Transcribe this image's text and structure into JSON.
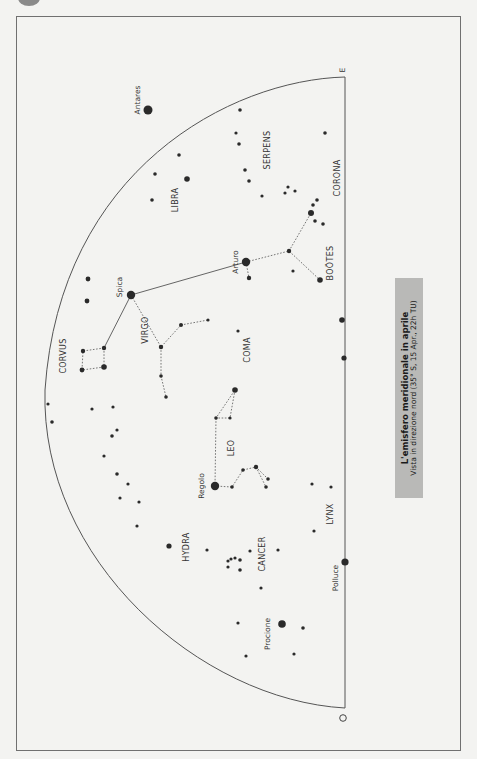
{
  "title": "L'emisfero meridionale in aprile",
  "subtitle": "Vista in direzione nord (35° S, 15 Apr., 22h TU)",
  "compass": {
    "east": "E",
    "west": "O"
  },
  "colors": {
    "background": "#f3f3f1",
    "ink": "#2a2a2a",
    "caption_bg": "#b9b9b7",
    "frame": "#707070"
  },
  "constellations": [
    "SERPENS",
    "CORONA",
    "LIBRA",
    "BOÖTES",
    "VIRGO",
    "COMA",
    "CORVUS",
    "LEO",
    "HYDRA",
    "CANCER",
    "LYNX"
  ],
  "stars": [
    "Antares",
    "Arturo",
    "Spica",
    "Regolo",
    "Procione",
    "Polluce"
  ],
  "labels": {
    "serpens": "SERPENS",
    "corona": "CORONA",
    "libra": "LIBRA",
    "bootes": "BOÖTES",
    "virgo": "VIRGO",
    "coma": "COMA",
    "corvus": "CORVUS",
    "leo": "LEO",
    "hydra": "HYDRA",
    "cancer": "CANCER",
    "lynx": "LYNX",
    "antares": "Antares",
    "arturo": "Arturo",
    "spica": "Spica",
    "regolo": "Regolo",
    "procione": "Procione",
    "polluce": "Polluce"
  }
}
